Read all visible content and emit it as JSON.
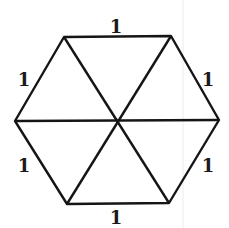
{
  "diagram": {
    "vertices": {
      "top_left": [
        64,
        37
      ],
      "top_right": [
        171,
        36
      ],
      "right": [
        219,
        120
      ],
      "bottom_right": [
        169,
        203
      ],
      "bottom_left": [
        67,
        204
      ],
      "left": [
        15,
        121
      ],
      "center": [
        117,
        121
      ]
    },
    "edge_labels": [
      {
        "edge": "top",
        "text": "1",
        "x": 116,
        "y": 33
      },
      {
        "edge": "upper-right",
        "text": "1",
        "x": 208,
        "y": 86
      },
      {
        "edge": "lower-right",
        "text": "1",
        "x": 208,
        "y": 172
      },
      {
        "edge": "bottom",
        "text": "1",
        "x": 116,
        "y": 224
      },
      {
        "edge": "lower-left",
        "text": "1",
        "x": 24,
        "y": 172
      },
      {
        "edge": "upper-left",
        "text": "1",
        "x": 24,
        "y": 86
      }
    ],
    "line_color": "#151515"
  }
}
